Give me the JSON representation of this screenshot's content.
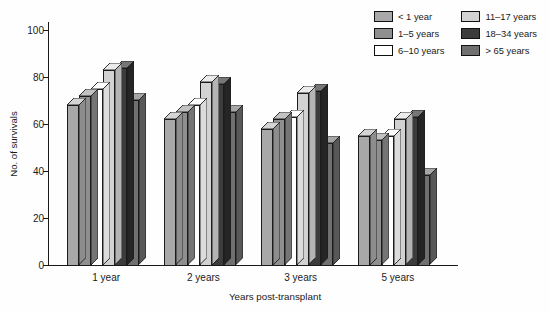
{
  "chart_data": {
    "type": "bar",
    "title": "",
    "xlabel": "Years post-transplant",
    "ylabel": "No. of survivals",
    "ylim": [
      0,
      100
    ],
    "yticks": [
      0,
      20,
      40,
      60,
      80,
      100
    ],
    "ytick_labels": [
      "0",
      "20",
      "40",
      "60",
      "80",
      "100"
    ],
    "grid": false,
    "legend_position": "top-right",
    "style": "3d-clustered-column",
    "categories": [
      "1 year",
      "2 years",
      "3 years",
      "5 years"
    ],
    "series": [
      {
        "name": "< 1 year",
        "color": "#a8a8a8",
        "top_color": "#d4d4d4",
        "side_color": "#8d8d8d",
        "values": [
          68,
          62,
          58,
          55
        ]
      },
      {
        "name": "1–5 years",
        "color": "#8f8f8f",
        "top_color": "#c2c2c2",
        "side_color": "#757575",
        "values": [
          72,
          65,
          62,
          53
        ]
      },
      {
        "name": "6–10 years",
        "color": "#ffffff",
        "top_color": "#ffffff",
        "side_color": "#dcdcdc",
        "values": [
          75,
          68,
          63,
          55
        ]
      },
      {
        "name": "11–17 years",
        "color": "#d2d2d2",
        "top_color": "#ebebeb",
        "side_color": "#b4b4b4",
        "values": [
          83,
          78,
          73,
          62
        ]
      },
      {
        "name": "18–34 years",
        "color": "#3c3c3c",
        "top_color": "#777777",
        "side_color": "#252525",
        "values": [
          84,
          77,
          74,
          63
        ]
      },
      {
        "name": "> 65 years",
        "color": "#707070",
        "top_color": "#a6a6a6",
        "side_color": "#585858",
        "values": [
          70,
          65,
          52,
          38
        ]
      }
    ]
  },
  "legend": {
    "entries": [
      {
        "label": "< 1 year",
        "swatch": "#a8a8a8"
      },
      {
        "label": "1–5 years",
        "swatch": "#8f8f8f"
      },
      {
        "label": "6–10 years",
        "swatch": "#ffffff"
      },
      {
        "label": "11–17 years",
        "swatch": "#d2d2d2"
      },
      {
        "label": "18–34 years",
        "swatch": "#3c3c3c"
      },
      {
        "label": "> 65 years",
        "swatch": "#707070"
      }
    ]
  }
}
